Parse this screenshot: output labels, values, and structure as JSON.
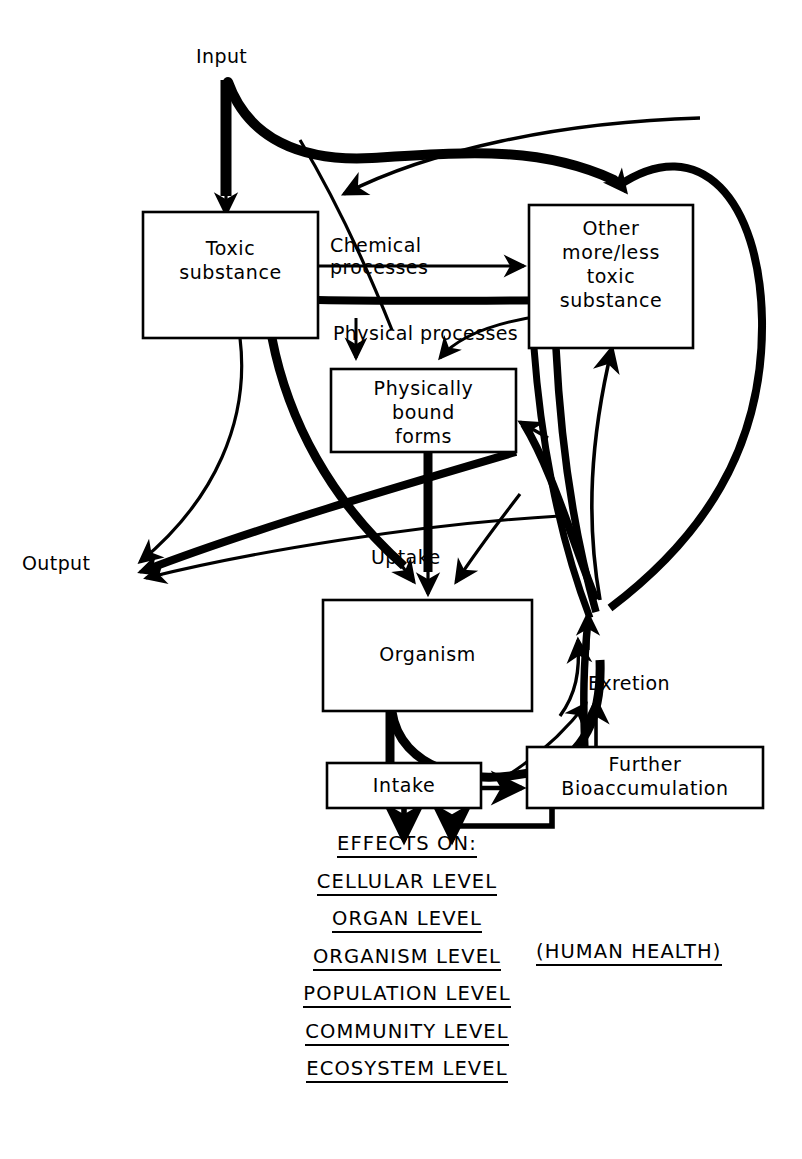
{
  "diagram": {
    "stroke_color": "#000000",
    "fill_color": "#ffffff",
    "background": "#ffffff"
  },
  "boxes": [
    {
      "id": "toxic-substance",
      "label": "Toxic\nsubstance"
    },
    {
      "id": "other-toxic-substance",
      "label": "Other\nmore/less\ntoxic\nsubstance"
    },
    {
      "id": "physically-bound-forms",
      "label": "Physically\nbound\nforms"
    },
    {
      "id": "organism",
      "label": "Organism"
    },
    {
      "id": "intake",
      "label": "Intake"
    },
    {
      "id": "further-bioaccumulation",
      "label": "Further\nBioaccumulation"
    }
  ],
  "labels": {
    "input": "Input",
    "output": "Output",
    "chemical_processes": "Chemical\nprocesses",
    "physical_processes": "Physical processes",
    "uptake": "Uptake",
    "exretion": "Exretion"
  },
  "effects": {
    "heading": "EFFECTS ON:",
    "items": [
      "CELLULAR LEVEL",
      "ORGAN LEVEL",
      "ORGANISM LEVEL",
      "POPULATION LEVEL",
      "COMMUNITY LEVEL",
      "ECOSYSTEM LEVEL"
    ],
    "annotation": "(HUMAN HEALTH)"
  }
}
